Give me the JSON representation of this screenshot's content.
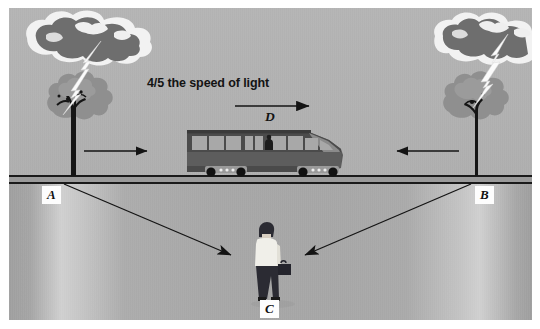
{
  "figure": {
    "background_color": "#ffffff",
    "sky_color": "#b0b0b0",
    "ground_color": "#a6a6a6",
    "line_color": "#141414"
  },
  "annotations": {
    "speed_caption": "4/5 the speed of light",
    "train_label": "D",
    "point_a": "A",
    "point_b": "B",
    "point_c": "C"
  },
  "arrows": [
    {
      "name": "train-direction-arrow",
      "label": "D",
      "direction": "right"
    },
    {
      "name": "light-from-a-arrow",
      "from": "A",
      "to": "C",
      "direction": "down-right"
    },
    {
      "name": "light-from-b-arrow",
      "from": "B",
      "to": "C",
      "direction": "down-left"
    },
    {
      "name": "ground-arrow-left",
      "direction": "right"
    },
    {
      "name": "ground-arrow-right",
      "direction": "left"
    }
  ],
  "objects": {
    "train": {
      "name": "train",
      "windows": 9,
      "wheel_trucks": 2,
      "passenger": true
    },
    "observer": {
      "name": "observer-c",
      "shirt_color": "#f0efe9",
      "trousers_color": "#2b2b33",
      "hair_color": "#2b2b33",
      "briefcase": true
    },
    "tree_left": {
      "name": "tree-left",
      "foliage_color": "#8f8f8f",
      "trunk_color": "#151515"
    },
    "tree_right": {
      "name": "tree-right",
      "foliage_color": "#8f8f8f",
      "trunk_color": "#151515"
    },
    "cloud_left": {
      "name": "cloud-left",
      "fill": "#6e6e6e",
      "edge": "#f2f2f2"
    },
    "cloud_right": {
      "name": "cloud-right",
      "fill": "#6e6e6e",
      "edge": "#f2f2f2"
    },
    "lightning_left": {
      "name": "lightning-bolt-left",
      "color": "#fbfbfb"
    },
    "lightning_right": {
      "name": "lightning-bolt-right",
      "color": "#fbfbfb"
    }
  }
}
